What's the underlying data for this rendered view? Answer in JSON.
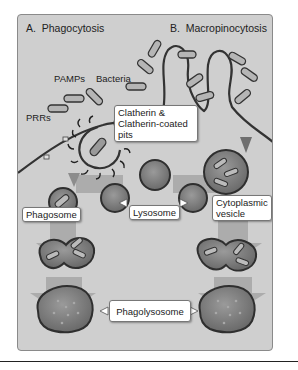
{
  "diagram": {
    "panels": [
      {
        "id": "A",
        "letter": "A.",
        "title": "Phagocytosis"
      },
      {
        "id": "B",
        "letter": "B.",
        "title": "Macropinocytosis"
      }
    ],
    "labels": {
      "pamps": "PAMPs",
      "bacteria": "Bacteria",
      "prrs": "PRRs"
    },
    "callouts": {
      "clatherin_line1": "Clatherin &",
      "clatherin_line2": "Clatherin-coated",
      "clatherin_line3": "pits",
      "phagosome": "Phagosome",
      "lysosome": "Lysosome",
      "cytoplasmic_line1": "Cytoplasmic",
      "cytoplasmic_line2": "vesicle",
      "phagolysosome": "Phagolysosome"
    },
    "colors": {
      "background": "#cfcfcf",
      "organelle_fill": "#7d7d7d",
      "organelle_stroke": "#2f2f2f",
      "arrow": "#a3a3a3",
      "membrane": "#333333"
    }
  }
}
